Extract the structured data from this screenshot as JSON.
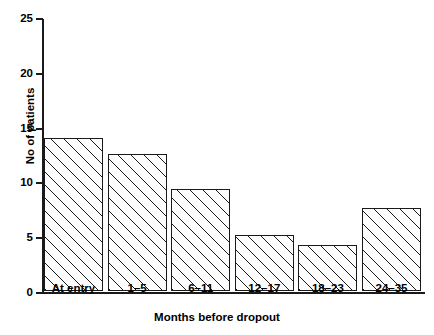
{
  "chart_data": {
    "type": "bar",
    "title": "",
    "xlabel": "Months before dropout",
    "ylabel": "No of patients",
    "categories": [
      "At entry",
      "1–5",
      "6–11",
      "12–17",
      "18–23",
      "24–35"
    ],
    "values": [
      14,
      12.5,
      9.3,
      5.1,
      4.2,
      7.6
    ],
    "ylim": [
      0,
      25
    ],
    "yticks": [
      0,
      5,
      10,
      15,
      20,
      25
    ],
    "ytick_labels": [
      "0",
      "5",
      "10",
      "15",
      "20",
      "25"
    ],
    "grid": false,
    "legend": null,
    "bar_style": {
      "fill": "diagonal-hatch",
      "edge_color": "#1a1a1a",
      "face_color": "#ffffff"
    }
  },
  "axes": {
    "y_title": "No of patients",
    "x_title": "Months before dropout"
  }
}
